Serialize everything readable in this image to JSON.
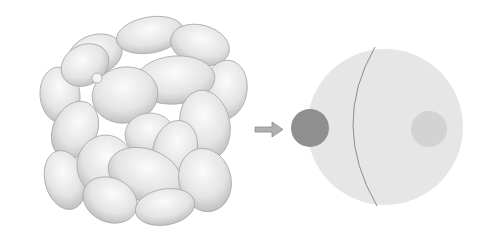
{
  "diagram": {
    "left_figure": {
      "type": "succulent-illustration",
      "color": "#d9d9d9"
    },
    "arrow": {
      "direction": "right",
      "color": "#9a9a9a"
    },
    "right_figure": {
      "main_circle": {
        "cx": 385,
        "cy": 127,
        "r": 78,
        "fill": "#e6e6e6"
      },
      "dividing_curve": {
        "stroke": "#8c8c8c"
      },
      "dark_circle": {
        "cx": 310,
        "cy": 128,
        "r": 19,
        "fill": "#8f8f8f"
      },
      "light_circle": {
        "cx": 429,
        "cy": 129,
        "r": 18,
        "fill": "#d3d3d3"
      }
    }
  }
}
